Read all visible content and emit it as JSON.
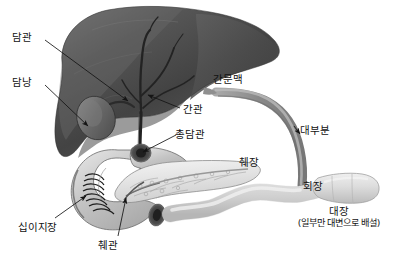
{
  "diagram": {
    "background_color": "#ffffff",
    "palette": {
      "liver_dark": "#3f3f3f",
      "liver_mid": "#5a5a5a",
      "liver_light": "#767676",
      "duct_dark": "#2e2e2e",
      "portal_vein": "#8c8c8c",
      "pancreas": "#e8e8e8",
      "duodenum": "#c9c9c9",
      "intestine": "#dcdcdc",
      "label_text": "#121212",
      "leader_line": "#1a1a1a"
    }
  },
  "labels": [
    {
      "id": "bile-duct",
      "text": "담관",
      "x": 12,
      "y": 32,
      "role": "organ-label"
    },
    {
      "id": "gallbladder",
      "text": "담낭",
      "x": 12,
      "y": 77,
      "role": "organ-label"
    },
    {
      "id": "portal-vein",
      "text": "간문맥",
      "x": 213,
      "y": 74,
      "role": "organ-label"
    },
    {
      "id": "hepatic-duct",
      "text": "간관",
      "x": 183,
      "y": 104,
      "role": "organ-label"
    },
    {
      "id": "common-bile-duct",
      "text": "총담관",
      "x": 175,
      "y": 129,
      "role": "organ-label"
    },
    {
      "id": "pancreas",
      "text": "췌장",
      "x": 239,
      "y": 157,
      "role": "organ-label"
    },
    {
      "id": "most-portion",
      "text": "대부분",
      "x": 300,
      "y": 125,
      "role": "flow-annotation"
    },
    {
      "id": "ileum",
      "text": "회장",
      "x": 303,
      "y": 181,
      "role": "organ-label"
    },
    {
      "id": "duodenum",
      "text": "십이지장",
      "x": 18,
      "y": 222,
      "role": "organ-label"
    },
    {
      "id": "pancreatic-duct",
      "text": "췌관",
      "x": 98,
      "y": 240,
      "role": "organ-label"
    }
  ],
  "colon_label": {
    "id": "large-intestine",
    "title": "대장",
    "note": "(일부만 대변으로 배설)",
    "x": 280,
    "y": 206
  },
  "structures": [
    {
      "id": "liver",
      "name": "간",
      "shape": "large lobed mass, dark gray, upper-left"
    },
    {
      "id": "gallbladder-sac",
      "name": "담낭",
      "shape": "oval sac beneath liver"
    },
    {
      "id": "hepatic-ducts",
      "name": "간관",
      "shape": "branching dark ducts inside liver"
    },
    {
      "id": "common-bile-duct-tube",
      "name": "총담관",
      "shape": "vertical dark duct to duodenum"
    },
    {
      "id": "portal-vein-tube",
      "name": "간문맥",
      "shape": "long curved gray vessel from liver to ileum"
    },
    {
      "id": "duodenum-loop",
      "name": "십이지장",
      "shape": "C-shaped loop with cut-away plicae"
    },
    {
      "id": "pancreas-body",
      "name": "췌장",
      "shape": "tapered pale organ with branching duct"
    },
    {
      "id": "pancreatic-duct-line",
      "name": "췌관",
      "shape": "thin duct within pancreas"
    },
    {
      "id": "ileum-tube",
      "name": "회장",
      "shape": "wavy pale tube to the right"
    },
    {
      "id": "colon-segment",
      "name": "대장",
      "shape": "wide pale block at far right"
    }
  ]
}
